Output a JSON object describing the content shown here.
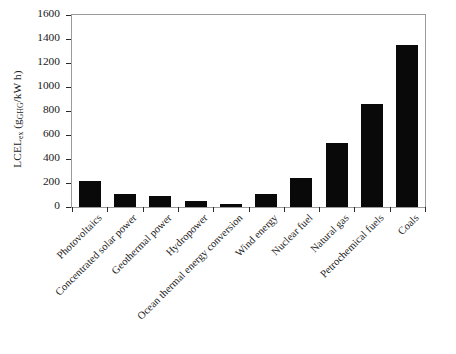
{
  "chart_data": {
    "type": "bar",
    "title": "",
    "xlabel": "",
    "ylabel": "LCELex (gGHG/kW h)",
    "ylabel_parts": {
      "main": "LCEL",
      "main_sub": "ex",
      "unit_open": " (g",
      "unit_sub": "GHG",
      "unit_close": "/kW h)"
    },
    "ylim": [
      0,
      1600
    ],
    "ytick_step": 200,
    "yticks": [
      0,
      200,
      400,
      600,
      800,
      1000,
      1200,
      1400,
      1600
    ],
    "ytick_labels": [
      "0",
      "200",
      "400",
      "600",
      "800",
      "1000",
      "1200",
      "1400",
      "1600"
    ],
    "grid": false,
    "legend": "none",
    "bar_color": "#090909",
    "axis_color": "#9b9b9b",
    "categories": [
      "Photovoltaics",
      "Concentrated solar power",
      "Geothermal power",
      "Hydropower",
      "Ocean thermal energy conversion",
      "Wind energy",
      "Nuclear fuel",
      "Natural gas",
      "Petrochemical fuels",
      "Coals"
    ],
    "values": [
      215,
      105,
      95,
      50,
      22,
      105,
      240,
      535,
      862,
      1348
    ]
  }
}
